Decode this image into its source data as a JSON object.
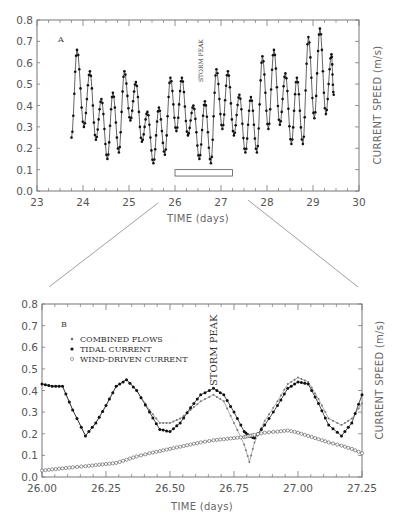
{
  "chart_data": [
    {
      "panel": "A",
      "type": "line",
      "title": "",
      "xlabel": "TIME (days)",
      "ylabel": "CURRENT SPEED (m/s)",
      "xlim": [
        23,
        30
      ],
      "ylim": [
        0.0,
        0.8
      ],
      "x_ticks": [
        "23",
        "24",
        "25",
        "26",
        "27",
        "28",
        "29",
        "30"
      ],
      "y_ticks": [
        "0.0",
        "0.1",
        "0.2",
        "0.3",
        "0.4",
        "0.5",
        "0.6",
        "0.7",
        "0.8"
      ],
      "grid": false,
      "annotation": "STORM PEAK",
      "annotation_x": 26.6,
      "highlight_box": {
        "x0": 26.0,
        "x1": 27.25,
        "y0": 0.07,
        "y1": 0.1
      },
      "series": [
        {
          "name": "Current speed",
          "marker": "dot",
          "peaks": [
            {
              "x": 23.87,
              "y": 0.66
            },
            {
              "x": 24.15,
              "y": 0.56
            },
            {
              "x": 24.4,
              "y": 0.43
            },
            {
              "x": 24.65,
              "y": 0.46
            },
            {
              "x": 24.9,
              "y": 0.56
            },
            {
              "x": 25.15,
              "y": 0.51
            },
            {
              "x": 25.4,
              "y": 0.37
            },
            {
              "x": 25.65,
              "y": 0.39
            },
            {
              "x": 25.9,
              "y": 0.53
            },
            {
              "x": 26.15,
              "y": 0.53
            },
            {
              "x": 26.4,
              "y": 0.4
            },
            {
              "x": 26.65,
              "y": 0.42
            },
            {
              "x": 26.9,
              "y": 0.57
            },
            {
              "x": 27.15,
              "y": 0.56
            },
            {
              "x": 27.4,
              "y": 0.45
            },
            {
              "x": 27.65,
              "y": 0.44
            },
            {
              "x": 27.9,
              "y": 0.63
            },
            {
              "x": 28.15,
              "y": 0.66
            },
            {
              "x": 28.4,
              "y": 0.55
            },
            {
              "x": 28.65,
              "y": 0.53
            },
            {
              "x": 28.9,
              "y": 0.72
            },
            {
              "x": 29.15,
              "y": 0.76
            },
            {
              "x": 29.4,
              "y": 0.64
            }
          ],
          "troughs": [
            {
              "x": 23.75,
              "y": 0.25
            },
            {
              "x": 24.02,
              "y": 0.3
            },
            {
              "x": 24.28,
              "y": 0.24
            },
            {
              "x": 24.53,
              "y": 0.15
            },
            {
              "x": 24.78,
              "y": 0.18
            },
            {
              "x": 25.03,
              "y": 0.33
            },
            {
              "x": 25.28,
              "y": 0.23
            },
            {
              "x": 25.53,
              "y": 0.13
            },
            {
              "x": 25.78,
              "y": 0.17
            },
            {
              "x": 26.03,
              "y": 0.28
            },
            {
              "x": 26.28,
              "y": 0.26
            },
            {
              "x": 26.53,
              "y": 0.15
            },
            {
              "x": 26.78,
              "y": 0.13
            },
            {
              "x": 27.03,
              "y": 0.29
            },
            {
              "x": 27.28,
              "y": 0.26
            },
            {
              "x": 27.53,
              "y": 0.18
            },
            {
              "x": 27.78,
              "y": 0.18
            },
            {
              "x": 28.03,
              "y": 0.29
            },
            {
              "x": 28.28,
              "y": 0.31
            },
            {
              "x": 28.53,
              "y": 0.22
            },
            {
              "x": 28.78,
              "y": 0.22
            },
            {
              "x": 29.03,
              "y": 0.34
            },
            {
              "x": 29.28,
              "y": 0.36
            },
            {
              "x": 29.45,
              "y": 0.45
            }
          ]
        }
      ]
    },
    {
      "panel": "B",
      "type": "line",
      "title": "",
      "xlabel": "TIME (days)",
      "ylabel": "CURRENT SPEED (m/s)",
      "xlim": [
        26.0,
        27.25
      ],
      "ylim": [
        0.0,
        0.8
      ],
      "x_ticks": [
        "26.00",
        "26.25",
        "26.50",
        "26.75",
        "27.00",
        "27.25"
      ],
      "y_ticks": [
        "0.0",
        "0.1",
        "0.2",
        "0.3",
        "0.4",
        "0.5",
        "0.6",
        "0.7",
        "0.8"
      ],
      "grid": false,
      "annotation": "STORM PEAK",
      "annotation_x": 26.67,
      "legend": [
        "COMBINED FLOWS",
        "TIDAL CURRENT",
        "WIND-DRIVEN CURRENT"
      ],
      "legend_position": "upper left",
      "x": [
        26.0,
        26.04,
        26.08,
        26.12,
        26.17,
        26.21,
        26.25,
        26.29,
        26.33,
        26.37,
        26.42,
        26.46,
        26.5,
        26.54,
        26.58,
        26.62,
        26.67,
        26.71,
        26.75,
        26.79,
        26.81,
        26.83,
        26.87,
        26.92,
        26.96,
        27.0,
        27.04,
        27.08,
        27.12,
        27.17,
        27.21,
        27.25
      ],
      "series": [
        {
          "name": "COMBINED FLOWS",
          "marker": "small-plus",
          "values": [
            0.43,
            0.42,
            0.42,
            0.31,
            0.19,
            0.25,
            0.33,
            0.42,
            0.45,
            0.4,
            0.31,
            0.25,
            0.25,
            0.27,
            0.31,
            0.35,
            0.38,
            0.35,
            0.25,
            0.15,
            0.07,
            0.16,
            0.26,
            0.35,
            0.43,
            0.46,
            0.44,
            0.36,
            0.27,
            0.24,
            0.27,
            0.34
          ]
        },
        {
          "name": "TIDAL CURRENT",
          "marker": "filled-dot",
          "values": [
            0.43,
            0.42,
            0.42,
            0.31,
            0.19,
            0.25,
            0.33,
            0.42,
            0.45,
            0.4,
            0.3,
            0.22,
            0.21,
            0.25,
            0.32,
            0.38,
            0.41,
            0.38,
            0.3,
            0.21,
            0.19,
            0.18,
            0.24,
            0.33,
            0.41,
            0.44,
            0.43,
            0.34,
            0.24,
            0.19,
            0.25,
            0.38
          ]
        },
        {
          "name": "WIND-DRIVEN CURRENT",
          "marker": "open-circle",
          "values": [
            0.03,
            0.035,
            0.04,
            0.045,
            0.05,
            0.055,
            0.06,
            0.065,
            0.08,
            0.095,
            0.11,
            0.12,
            0.13,
            0.14,
            0.15,
            0.16,
            0.17,
            0.175,
            0.18,
            0.185,
            0.19,
            0.195,
            0.205,
            0.21,
            0.215,
            0.205,
            0.19,
            0.175,
            0.16,
            0.145,
            0.13,
            0.11
          ]
        }
      ]
    }
  ],
  "labels": {
    "panel_a": "A",
    "panel_b": "B",
    "storm_peak": "STORM PEAK",
    "xlabel": "TIME (days)",
    "ylabel": "CURRENT SPEED (m/s)"
  },
  "colors": {
    "axis": "#666666",
    "series_dark": "#111111",
    "series_light": "#888888",
    "text": "#555555"
  }
}
